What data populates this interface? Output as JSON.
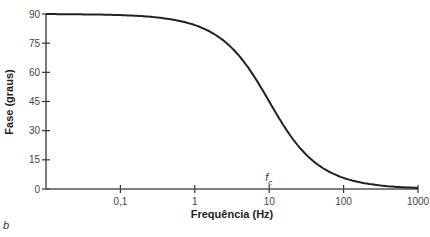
{
  "chart_data": {
    "type": "line",
    "title": "",
    "xlabel": "Frequência (Hz)",
    "ylabel": "Fase (graus)",
    "xscale": "log",
    "xlim": [
      0.01,
      1000
    ],
    "ylim": [
      0,
      90
    ],
    "x_ticks": [
      0.1,
      1,
      10,
      100,
      1000
    ],
    "x_tick_labels": [
      "0,1",
      "1",
      "10",
      "100",
      "1000"
    ],
    "y_ticks": [
      0,
      15,
      30,
      45,
      60,
      75,
      90
    ],
    "y_tick_labels": [
      "0",
      "15",
      "30",
      "45",
      "60",
      "75",
      "90"
    ],
    "grid": false,
    "legend": null,
    "series": [
      {
        "name": "Fase",
        "x": [
          0.01,
          0.1,
          1,
          3,
          10,
          30,
          100,
          300,
          1000
        ],
        "values": [
          89.9,
          89.4,
          84.3,
          73.3,
          45.0,
          18.4,
          5.7,
          1.9,
          0.6
        ]
      }
    ],
    "annotations": [
      {
        "text": "f",
        "subscript": "c",
        "x": 10,
        "meaning": "cutoff frequency"
      }
    ],
    "panel_label": "b"
  }
}
